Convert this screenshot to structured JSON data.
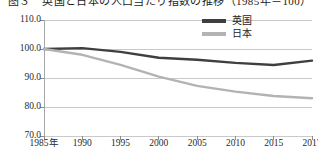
{
  "figure": {
    "title_partial": "图３　英国と日本の人口当たり指数の推移（1985年＝100）",
    "background": "#ffffff"
  },
  "legend": {
    "position": "top-right",
    "entries": [
      {
        "label": "英国",
        "color": "#3f3f3f"
      },
      {
        "label": "日本",
        "color": "#b3b3b3"
      }
    ]
  },
  "chart_data": {
    "type": "line",
    "title": "",
    "xlabel": "",
    "ylabel": "",
    "x": [
      "1985年",
      "1990",
      "1995",
      "2000",
      "2005",
      "2010",
      "2015",
      "2017"
    ],
    "x_values": [
      1985,
      1990,
      1995,
      2000,
      2005,
      2010,
      2015,
      2017
    ],
    "categories": [
      "1985年",
      "1990",
      "1995",
      "2000",
      "2005",
      "2010",
      "2015",
      "2017"
    ],
    "xtick_labels": [
      "1985年",
      "1990",
      "1995",
      "2000",
      "2005",
      "2010",
      "2015",
      "2017"
    ],
    "ytick_labels": [
      "110.0",
      "100.0",
      "90.0",
      "80.0",
      "70.0"
    ],
    "ytick_values": [
      110.0,
      100.0,
      90.0,
      80.0,
      70.0
    ],
    "ylim": [
      70.0,
      110.0
    ],
    "grid": true,
    "grid_axis": "y",
    "legend_position": "top-right",
    "series": [
      {
        "name": "英国",
        "color": "#3f3f3f",
        "values": [
          100.0,
          100.3,
          99.0,
          97.0,
          96.3,
          95.2,
          94.5,
          96.0
        ]
      },
      {
        "name": "日本",
        "color": "#b3b3b3",
        "values": [
          100.0,
          98.0,
          94.5,
          90.5,
          87.3,
          85.3,
          83.8,
          83.0
        ]
      }
    ]
  }
}
